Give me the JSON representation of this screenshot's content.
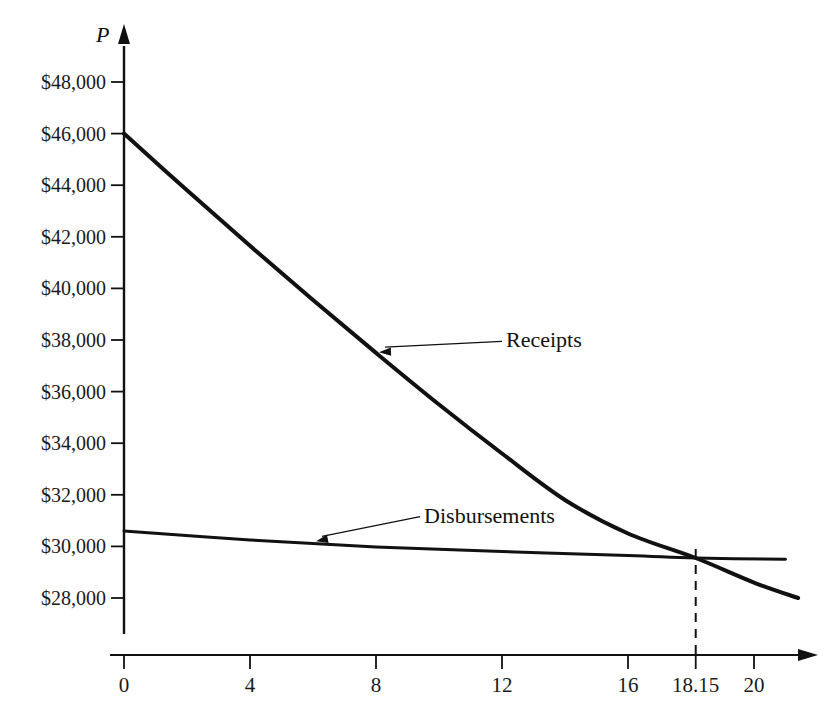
{
  "chart_data": {
    "type": "line",
    "title": "",
    "xlabel": "",
    "ylabel": "P",
    "ylabel_is_italic": true,
    "grid": false,
    "legend_position": "inline-annotations",
    "xlim": [
      0,
      21.6
    ],
    "ylim": [
      26800,
      49200
    ],
    "x_ticks": [
      "0",
      "4",
      "8",
      "12",
      "16",
      "18.15",
      "20"
    ],
    "x_tick_values": [
      0,
      4,
      8,
      12,
      16,
      18.15,
      20
    ],
    "y_ticks": [
      "$48,000",
      "$46,000",
      "$44,000",
      "$42,000",
      "$40,000",
      "$38,000",
      "$36,000",
      "$34,000",
      "$32,000",
      "$30,000",
      "$28,000"
    ],
    "y_tick_values": [
      48000,
      46000,
      44000,
      42000,
      40000,
      38000,
      36000,
      34000,
      32000,
      30000,
      28000
    ],
    "series": [
      {
        "name": "Receipts",
        "x": [
          0,
          2,
          4,
          6,
          8,
          10,
          12,
          14,
          16,
          18.15,
          20,
          21.4
        ],
        "values": [
          46000,
          43800,
          41650,
          39550,
          37500,
          35500,
          33600,
          31800,
          30500,
          29550,
          28600,
          28000
        ],
        "color": "#111111",
        "line_width": 4
      },
      {
        "name": "Disbursements",
        "x": [
          0,
          4,
          8,
          12,
          16,
          18.15,
          21.0
        ],
        "values": [
          30600,
          30250,
          29980,
          29800,
          29650,
          29550,
          29500
        ],
        "color": "#111111",
        "line_width": 3
      }
    ],
    "annotations": [
      {
        "label": "Receipts",
        "text_x": 12.0,
        "text_y": 37950,
        "point_x": 8.0,
        "point_y": 37450
      },
      {
        "label": "Disbursements",
        "text_x": 9.4,
        "text_y": 31150,
        "point_x": 6.0,
        "point_y": 30120
      }
    ],
    "breakeven": {
      "x": 18.15,
      "y": 29550,
      "marker": "dashed-vertical-line"
    }
  }
}
